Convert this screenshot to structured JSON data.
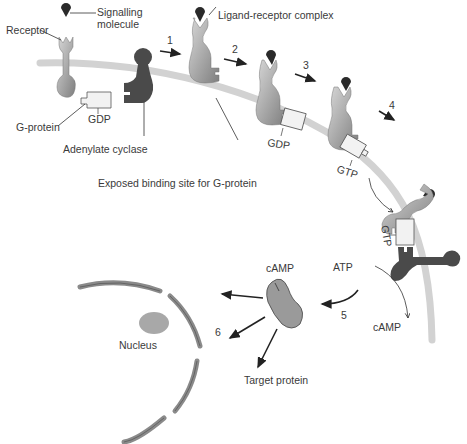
{
  "labels": {
    "signalling_molecule_line1": "Signalling",
    "signalling_molecule_line2": "molecule",
    "receptor": "Receptor",
    "ligand_receptor_complex": "Ligand-receptor complex",
    "g_protein": "G-protein",
    "gdp_1": "GDP",
    "gdp_2": "GDP",
    "gtp_1": "GTP",
    "gtp_2": "GTP",
    "adenylate_cyclase": "Adenylate cyclase",
    "exposed_binding_site": "Exposed binding site for G-protein",
    "atp": "ATP",
    "camp_product": "cAMP",
    "camp_molecule": "cAMP",
    "nucleus": "Nucleus",
    "target_protein": "Target protein"
  },
  "steps": [
    "1",
    "2",
    "3",
    "4",
    "5",
    "6"
  ],
  "colors": {
    "membrane": "#d2d2d2",
    "receptor_light": "#c4c4c4",
    "receptor_dark": "#8a8a8a",
    "adenylate_cyclase": "#4a4a4a",
    "ligand": "#2a2a2a",
    "g_protein_fill": "#f2f2f2",
    "camp_fill": "#9a9a9a",
    "nuclear_envelope": "#8a8a8a",
    "nucleolus": "#a8a8a8",
    "text": "#3a3a3a",
    "arrow": "#222222"
  }
}
